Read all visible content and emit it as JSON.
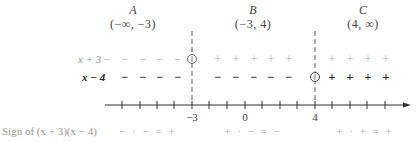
{
  "intervals": [
    {
      "letter": "A",
      "range": "(−∞, −3)",
      "x": 133
    },
    {
      "letter": "B",
      "range": "(−3, 4)",
      "x": 253
    },
    {
      "letter": "C",
      "range": "(4, ∞)",
      "x": 363
    }
  ],
  "factors": [
    {
      "label": "x + 3",
      "style": "light",
      "y": 59,
      "signs": [
        {
          "x": 107,
          "s": "−"
        },
        {
          "x": 125,
          "s": "−"
        },
        {
          "x": 143,
          "s": "−"
        },
        {
          "x": 160,
          "s": "−"
        },
        {
          "x": 178,
          "s": "−"
        },
        {
          "x": 218,
          "s": "+"
        },
        {
          "x": 236,
          "s": "+"
        },
        {
          "x": 254,
          "s": "+"
        },
        {
          "x": 271,
          "s": "+"
        },
        {
          "x": 289,
          "s": "+"
        },
        {
          "x": 332,
          "s": "+"
        },
        {
          "x": 350,
          "s": "+"
        },
        {
          "x": 368,
          "s": "+"
        },
        {
          "x": 386,
          "s": "+"
        }
      ],
      "zero_at_x": 192
    },
    {
      "label": "x − 4",
      "style": "bold",
      "y": 77,
      "signs": [
        {
          "x": 125,
          "s": "−"
        },
        {
          "x": 143,
          "s": "−"
        },
        {
          "x": 160,
          "s": "−"
        },
        {
          "x": 178,
          "s": "−"
        },
        {
          "x": 218,
          "s": "−"
        },
        {
          "x": 236,
          "s": "−"
        },
        {
          "x": 254,
          "s": "−"
        },
        {
          "x": 271,
          "s": "−"
        },
        {
          "x": 289,
          "s": "−"
        },
        {
          "x": 332,
          "s": "+"
        },
        {
          "x": 350,
          "s": "+"
        },
        {
          "x": 368,
          "s": "+"
        },
        {
          "x": 386,
          "s": "+"
        }
      ],
      "zero_at_x": 315
    }
  ],
  "number_line": {
    "y": 105,
    "x_start": 105,
    "x_end": 411,
    "ticks_x": [
      122,
      140,
      157,
      174,
      192,
      209,
      227,
      245,
      262,
      280,
      297,
      315,
      332,
      350,
      367,
      385
    ],
    "labels": [
      {
        "text": "−3",
        "x": 192
      },
      {
        "text": "0",
        "x": 245
      },
      {
        "text": "4",
        "x": 315
      }
    ],
    "critical_x": [
      192,
      315
    ]
  },
  "sign_row": {
    "label": "Sign of (x + 3)(x − 4)",
    "products": [
      {
        "text": "− · − = +",
        "x": 148
      },
      {
        "text": "+ · − = −",
        "x": 253
      },
      {
        "text": "+ · + = +",
        "x": 365
      }
    ]
  },
  "colors": {
    "light_sign": "#aaaaaa",
    "bold_sign": "#222222",
    "axis": "#333333",
    "dashed": "#555555"
  }
}
